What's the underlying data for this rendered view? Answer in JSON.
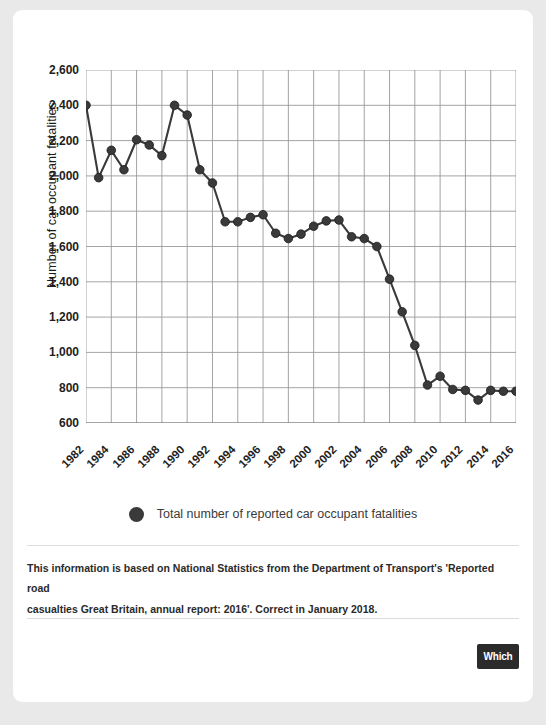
{
  "card": {
    "footnote_line1": "This information is based on National Statistics from the Department of Transport's 'Reported road",
    "footnote_line2": "casualties Great Britain, annual report: 2016'. Correct in January 2018.",
    "brand_label": "Which"
  },
  "legend": {
    "swatch_icon": "filled-circle-icon",
    "label": "Total number of reported car occupant fatalities",
    "color": "#3a3a3a"
  },
  "chart_data": {
    "type": "line",
    "title": "",
    "xlabel": "",
    "ylabel": "Number of car occupant fatalities",
    "ylim": [
      600,
      2600
    ],
    "ytick_step": 200,
    "yticks": [
      "2,600",
      "2,400",
      "2,200",
      "2,000",
      "1,800",
      "1,600",
      "1,400",
      "1,200",
      "1,000",
      "800",
      "600"
    ],
    "ytick_values": [
      2600,
      2400,
      2200,
      2000,
      1800,
      1600,
      1400,
      1200,
      1000,
      800,
      600
    ],
    "xlim": [
      1982,
      2016
    ],
    "xticks": [
      "1982",
      "1984",
      "1986",
      "1988",
      "1990",
      "1992",
      "1994",
      "1996",
      "1998",
      "2000",
      "2002",
      "2004",
      "2006",
      "2008",
      "2010",
      "2012",
      "2014",
      "2016"
    ],
    "xtick_values": [
      1982,
      1984,
      1986,
      1988,
      1990,
      1992,
      1994,
      1996,
      1998,
      2000,
      2002,
      2004,
      2006,
      2008,
      2010,
      2012,
      2014,
      2016
    ],
    "grid": true,
    "legend_position": "bottom-center",
    "marker": "circle",
    "series": [
      {
        "name": "Total number of reported car occupant fatalities",
        "color": "#3a3a3a",
        "x": [
          1982,
          1983,
          1984,
          1985,
          1986,
          1987,
          1988,
          1989,
          1990,
          1991,
          1992,
          1993,
          1994,
          1995,
          1996,
          1997,
          1998,
          1999,
          2000,
          2001,
          2002,
          2003,
          2004,
          2005,
          2006,
          2007,
          2008,
          2009,
          2010,
          2011,
          2012,
          2013,
          2014,
          2015,
          2016
        ],
        "values": [
          2400,
          1990,
          2145,
          2035,
          2205,
          2175,
          2115,
          2400,
          2345,
          2035,
          1960,
          1740,
          1740,
          1765,
          1780,
          1675,
          1645,
          1670,
          1715,
          1745,
          1750,
          1655,
          1645,
          1600,
          1415,
          1230,
          1040,
          815,
          865,
          790,
          785,
          730,
          785,
          780,
          780
        ]
      }
    ]
  }
}
